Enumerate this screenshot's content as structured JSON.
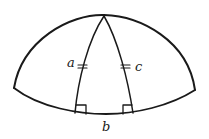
{
  "diagram": {
    "type": "spherical-triangle",
    "labels": {
      "a": "a",
      "b": "b",
      "c": "c"
    },
    "markings": {
      "equal_ticks_on": [
        "a",
        "c"
      ],
      "right_angles_at": [
        "base-left",
        "base-right"
      ]
    },
    "colors": {
      "stroke": "#1a1a1a",
      "background": "#ffffff"
    }
  }
}
